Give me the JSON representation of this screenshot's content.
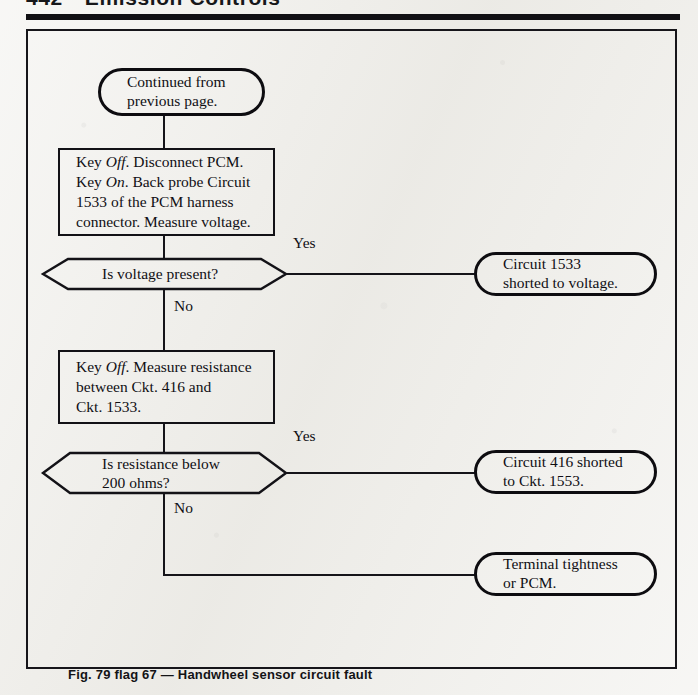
{
  "page": {
    "running_head_number": "442",
    "running_head_title": "Emission Controls"
  },
  "figure": {
    "caption": "Fig. 79  flag 67 — Handwheel sensor circuit fault"
  },
  "flowchart": {
    "type": "flowchart",
    "nodes": {
      "start_terminal": {
        "shape": "stadium",
        "line1": "Continued from",
        "line2": "previous page."
      },
      "process_1": {
        "shape": "rectangle",
        "line1_a": "Key ",
        "line1_em": "Off",
        "line1_b": ". Disconnect PCM.",
        "line2_a": "Key ",
        "line2_em": "On",
        "line2_b": ". Back probe Circuit",
        "line3": "1533 of the PCM harness",
        "line4": "connector. Measure voltage."
      },
      "decision_1": {
        "shape": "hexagon",
        "text": "Is voltage present?",
        "yes_label": "Yes",
        "no_label": "No"
      },
      "result_1": {
        "shape": "stadium",
        "line1": "Circuit 1533",
        "line2": "shorted to voltage."
      },
      "process_2": {
        "shape": "rectangle",
        "line1_a": "Key ",
        "line1_em": "Off",
        "line1_b": ". Measure resistance",
        "line2": "between Ckt. 416 and",
        "line3": "Ckt. 1533."
      },
      "decision_2": {
        "shape": "hexagon",
        "line1": "Is resistance below",
        "line2": "200 ohms?",
        "yes_label": "Yes",
        "no_label": "No"
      },
      "result_2": {
        "shape": "stadium",
        "line1": "Circuit 416 shorted",
        "line2": "to Ckt. 1553."
      },
      "result_3": {
        "shape": "stadium",
        "line1": "Terminal tightness",
        "line2": "or PCM."
      }
    }
  },
  "colors": {
    "ink": "#121116",
    "paper": "#efeeea"
  }
}
